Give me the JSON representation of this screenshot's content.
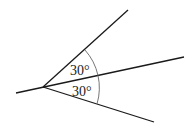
{
  "diagram": {
    "type": "angle-diagram",
    "vertex": {
      "x": 43,
      "y": 87
    },
    "angles": [
      {
        "label": "30°",
        "position": "upper"
      },
      {
        "label": "30°",
        "position": "lower"
      }
    ],
    "colors": {
      "line": "#1a1a1a",
      "arc": "#666666",
      "background": "#ffffff"
    }
  }
}
